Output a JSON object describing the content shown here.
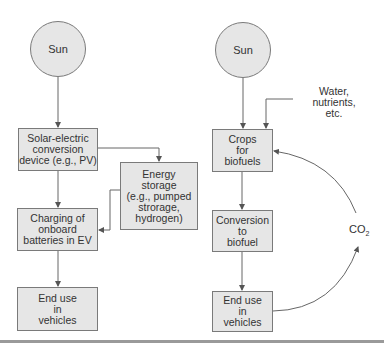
{
  "diagram": {
    "left_pathway": {
      "sun": {
        "label": "Sun"
      },
      "solar_device": {
        "label": "Solar-electric\nconversion\ndevice (e.g., PV)"
      },
      "energy_storage": {
        "label": "Energy\nstorage\n(e.g., pumped\nstrorage,\nhydrogen)"
      },
      "charging": {
        "label": "Charging of\nonboard\nbatteries in EV"
      },
      "end_use": {
        "label": "End use\nin\nvehicles"
      }
    },
    "right_pathway": {
      "sun": {
        "label": "Sun"
      },
      "inputs": {
        "label": "Water,\nnutrients,\netc."
      },
      "crops": {
        "label": "Crops\nfor\nbiofuels"
      },
      "conversion": {
        "label": "Conversion\nto\nbiofuel"
      },
      "end_use": {
        "label": "End use\nin\nvehicles"
      },
      "co2": {
        "label": "CO",
        "subscript": "2"
      }
    },
    "edges": [
      {
        "from": "Sun (left)",
        "to": "Solar-electric conversion device"
      },
      {
        "from": "Solar-electric conversion device",
        "to": "Energy storage"
      },
      {
        "from": "Solar-electric conversion device",
        "to": "Charging of onboard batteries in EV"
      },
      {
        "from": "Energy storage",
        "to": "Charging of onboard batteries in EV"
      },
      {
        "from": "Charging of onboard batteries in EV",
        "to": "End use in vehicles (left)"
      },
      {
        "from": "Sun (right)",
        "to": "Crops for biofuels"
      },
      {
        "from": "Water, nutrients, etc.",
        "to": "Crops for biofuels"
      },
      {
        "from": "Crops for biofuels",
        "to": "Conversion to biofuel"
      },
      {
        "from": "Conversion to biofuel",
        "to": "End use in vehicles (right)"
      },
      {
        "from": "End use in vehicles (right)",
        "to": "CO2"
      },
      {
        "from": "CO2",
        "to": "Crops for biofuels"
      }
    ],
    "colors": {
      "box_fill": "#e6e6e6",
      "box_border": "#7a7a7a",
      "line": "#555555",
      "text": "#333333"
    }
  }
}
